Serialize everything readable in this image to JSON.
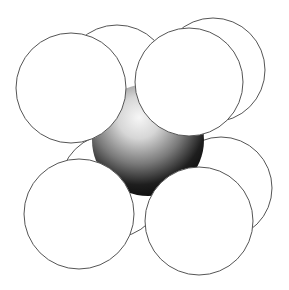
{
  "diagram": {
    "colors": {
      "background": "#ffffff",
      "sphere_fill": "#ffffff",
      "sphere_outline": "#555555",
      "center_highlight": "#f4f4f4",
      "center_shadow": "#0a0a0a"
    },
    "center_atom": {
      "cx": 148,
      "cy": 140,
      "r": 56
    },
    "corner_atoms": [
      {
        "id": "top-back-left",
        "cx": 117,
        "cy": 78,
        "r": 53
      },
      {
        "id": "top-back-right",
        "cx": 213,
        "cy": 70,
        "r": 52
      },
      {
        "id": "bottom-back-left",
        "cx": 112,
        "cy": 186,
        "r": 52
      },
      {
        "id": "bottom-back-right",
        "cx": 221,
        "cy": 188,
        "r": 51
      },
      {
        "id": "top-front-left",
        "cx": 71,
        "cy": 88,
        "r": 55
      },
      {
        "id": "top-front-right",
        "cx": 189,
        "cy": 82,
        "r": 54
      },
      {
        "id": "bottom-front-left",
        "cx": 79,
        "cy": 214,
        "r": 55
      },
      {
        "id": "bottom-front-right",
        "cx": 199,
        "cy": 221,
        "r": 54
      }
    ]
  }
}
